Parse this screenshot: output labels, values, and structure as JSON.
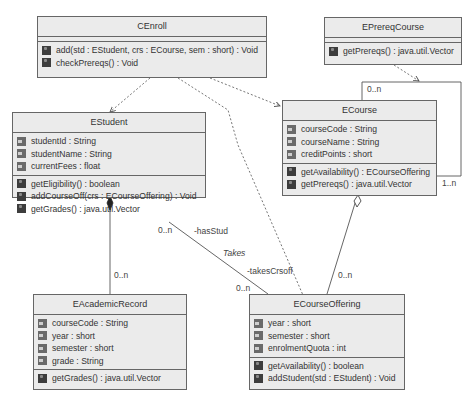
{
  "classes": {
    "cenroll": {
      "name": "CEnroll",
      "attributes": [],
      "operations": [
        "add(std : EStudent, crs : ECourse, sem : short) : Void",
        "checkPrereqs() : Void"
      ]
    },
    "eprereqcourse": {
      "name": "EPrereqCourse",
      "attributes": [],
      "operations": [
        "getPrereqs() : java.util.Vector"
      ]
    },
    "estudent": {
      "name": "EStudent",
      "attributes": [
        "studentId : String",
        "studentName : String",
        "currentFees : float"
      ],
      "operations": [
        "getEligibility() : boolean",
        "addCourseOff(crs : ECourseOffering) : Void",
        "getGrades() : java.util.Vector"
      ]
    },
    "ecourse": {
      "name": "ECourse",
      "attributes": [
        "courseCode : String",
        "courseName : String",
        "creditPoints : short"
      ],
      "operations": [
        "getAvailability() : ECourseOffering",
        "getPrereqs() : java.util.Vector"
      ]
    },
    "eacademicrecord": {
      "name": "EAcademicRecord",
      "attributes": [
        "courseCode : String",
        "year : short",
        "semester : short",
        "grade : String"
      ],
      "operations": [
        "getGrades() : java.util.Vector"
      ]
    },
    "ecourseoffering": {
      "name": "ECourseOffering",
      "attributes": [
        "year : short",
        "semester : short",
        "enrolmentQuota : int"
      ],
      "operations": [
        "getAvailability() : boolean",
        "addStudent(std : EStudent) : Void"
      ]
    }
  },
  "labels": {
    "ecourse_self_top": "0..n",
    "ecourse_self_right": "1..n",
    "student_record_mult": "0..n",
    "takes_student_mult": "0..n",
    "takes_role_student": "-hasStud",
    "takes_name": "Takes",
    "takes_role_offering": "-takesCrsoff",
    "takes_offering_mult": "0..n",
    "course_offering_mult": "0..n"
  },
  "icons": {
    "attribute": "attribute-icon",
    "operation": "operation-icon"
  },
  "colors": {
    "box_fill": "#ebebeb",
    "box_border": "#666666",
    "line": "#555555"
  }
}
